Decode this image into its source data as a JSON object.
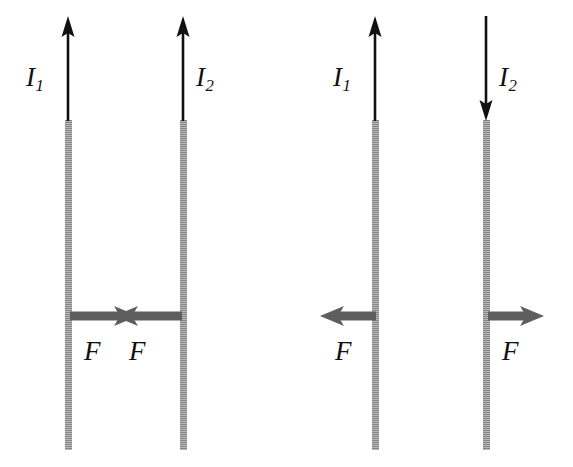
{
  "figure": {
    "background_color": "#ffffff",
    "wire_color": "#9a9a9a",
    "current_arrow_color": "#111111",
    "force_arrow_color": "#5e5e5e"
  },
  "panels": [
    {
      "id": "attraction",
      "currents": [
        {
          "label": "I",
          "subscript": "1",
          "direction": "up"
        },
        {
          "label": "I",
          "subscript": "2",
          "direction": "up"
        }
      ],
      "forces": [
        {
          "label": "F",
          "direction": "right"
        },
        {
          "label": "F",
          "direction": "left"
        }
      ]
    },
    {
      "id": "repulsion",
      "currents": [
        {
          "label": "I",
          "subscript": "1",
          "direction": "up"
        },
        {
          "label": "I",
          "subscript": "2",
          "direction": "down"
        }
      ],
      "forces": [
        {
          "label": "F",
          "direction": "left"
        },
        {
          "label": "F",
          "direction": "right"
        }
      ]
    }
  ]
}
